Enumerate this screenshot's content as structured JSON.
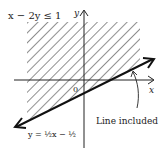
{
  "title": "x − 2y ≤ 1",
  "axes": {
    "x_label": "x",
    "y_label": "y",
    "origin_label": "0"
  },
  "boundary": {
    "equation_label": "y = ½x − ½",
    "style": "solid"
  },
  "annotation": {
    "text": "Line included"
  },
  "shading": {
    "region": "above line",
    "pattern": "diagonal hatch"
  },
  "colors": {
    "ink": "#222222",
    "background": "#ffffff"
  }
}
